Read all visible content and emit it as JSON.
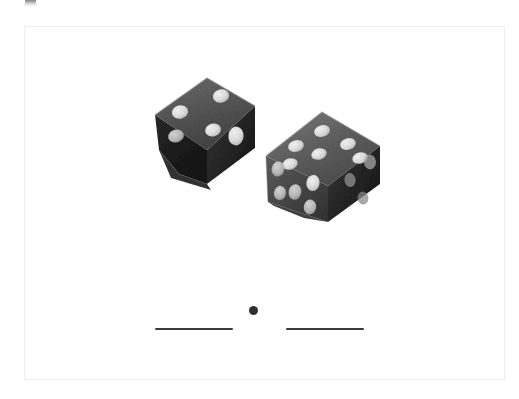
{
  "page": {
    "background_color": "#ffffff",
    "width": 519,
    "height": 399,
    "frame": {
      "border_color": "#efefef",
      "x": 24,
      "y": 26,
      "width": 481,
      "height": 354
    }
  },
  "worksheet": {
    "type": "fill-in-the-blank",
    "prompt_text": "",
    "answer_format": "two blanks separated by a decimal point",
    "blank_left_label": "",
    "blank_right_label": "",
    "decimal_point": "."
  },
  "photo": {
    "subject": "two dice",
    "style": "grayscale photograph",
    "die_body_color": "#585858",
    "die_shadow_color": "#232323",
    "die_highlight_color": "#8d8d8d",
    "pip_color": "#e9e9e9",
    "dice": [
      {
        "name": "left-die",
        "position": {
          "x": 148,
          "y": 70,
          "width": 108,
          "height": 110
        },
        "rotation_deg": -12,
        "faces": [
          {
            "name": "upper-left-face",
            "pip_count": 4,
            "shade": "mid"
          },
          {
            "name": "right-face",
            "pip_count": 1,
            "shade": "dark"
          },
          {
            "name": "bottom-face",
            "pip_count": 0,
            "shade": "darkest"
          }
        ]
      },
      {
        "name": "right-die",
        "position": {
          "x": 262,
          "y": 105,
          "width": 118,
          "height": 122
        },
        "rotation_deg": 6,
        "faces": [
          {
            "name": "top-face",
            "pip_count": 6,
            "shade": "mid"
          },
          {
            "name": "left-face",
            "pip_count": 5,
            "shade": "mid-dark"
          },
          {
            "name": "right-face",
            "pip_count": 3,
            "shade": "darkest"
          }
        ]
      }
    ]
  },
  "artifact": {
    "name": "cropped-edge-mark",
    "color": "#6f6f6f"
  }
}
